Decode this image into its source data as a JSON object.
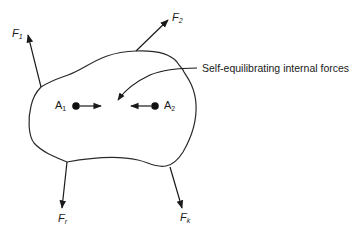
{
  "diagram": {
    "type": "free-body-diagram",
    "body": {
      "shape": "irregular-closed-curve",
      "stroke": "#2a2a2a"
    },
    "external_forces": [
      {
        "id": "F1",
        "symbol": "F",
        "subscript": "1",
        "direction": "up-left"
      },
      {
        "id": "F2",
        "symbol": "F",
        "subscript": "2",
        "direction": "up-right"
      },
      {
        "id": "Fr",
        "symbol": "F",
        "subscript": "r",
        "direction": "down"
      },
      {
        "id": "Fk",
        "symbol": "F",
        "subscript": "k",
        "direction": "down-right"
      }
    ],
    "points": [
      {
        "id": "A1",
        "symbol": "A",
        "subscript": "1",
        "force_direction": "right"
      },
      {
        "id": "A2",
        "symbol": "A",
        "subscript": "2",
        "force_direction": "left"
      }
    ],
    "annotation": {
      "text": "Self-equilibrating internal forces"
    }
  }
}
